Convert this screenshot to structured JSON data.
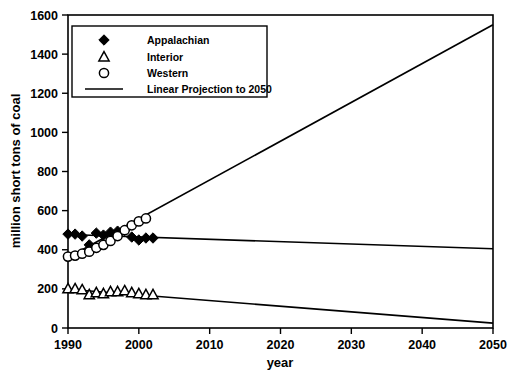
{
  "chart_data": {
    "type": "scatter",
    "title": "",
    "xlabel": "year",
    "ylabel": "million short tons of coal",
    "xlim": [
      1990,
      2050
    ],
    "ylim": [
      0,
      1600
    ],
    "xticks": [
      1990,
      2000,
      2010,
      2020,
      2030,
      2040,
      2050
    ],
    "yticks": [
      0,
      200,
      400,
      600,
      800,
      1000,
      1200,
      1400,
      1600
    ],
    "grid": false,
    "legend_position": "top-left",
    "legend": [
      {
        "label": "Appalachian",
        "marker": "filled-diamond"
      },
      {
        "label": "Interior",
        "marker": "open-triangle"
      },
      {
        "label": "Western",
        "marker": "open-circle"
      },
      {
        "label": "Linear Projection to 2050",
        "marker": "line"
      }
    ],
    "series": [
      {
        "name": "Appalachian",
        "marker": "filled-diamond",
        "x": [
          1990,
          1991,
          1992,
          1993,
          1994,
          1995,
          1996,
          1997,
          1998,
          1999,
          2000,
          2001,
          2002
        ],
        "values": [
          480,
          480,
          470,
          425,
          485,
          475,
          490,
          495,
          500,
          465,
          450,
          460,
          460
        ]
      },
      {
        "name": "Interior",
        "marker": "open-triangle",
        "x": [
          1990,
          1991,
          1992,
          1993,
          1994,
          1995,
          1996,
          1997,
          1998,
          1999,
          2000,
          2001,
          2002
        ],
        "values": [
          200,
          200,
          195,
          170,
          180,
          175,
          185,
          185,
          190,
          180,
          175,
          170,
          170
        ]
      },
      {
        "name": "Western",
        "marker": "open-circle",
        "x": [
          1990,
          1991,
          1992,
          1993,
          1994,
          1995,
          1996,
          1997,
          1998,
          1999,
          2000,
          2001
        ],
        "values": [
          365,
          370,
          380,
          390,
          410,
          425,
          445,
          470,
          500,
          525,
          545,
          560
        ]
      },
      {
        "name": "Linear Projection to 2050 - Western",
        "marker": "line",
        "x": [
          1990,
          2050
        ],
        "values": [
          360,
          1550
        ]
      },
      {
        "name": "Linear Projection to 2050 - Appalachian",
        "marker": "line",
        "x": [
          1990,
          2050
        ],
        "values": [
          478,
          405
        ]
      },
      {
        "name": "Linear Projection to 2050 - Interior",
        "marker": "line",
        "x": [
          1990,
          2050
        ],
        "values": [
          198,
          25
        ]
      }
    ]
  },
  "figure": {
    "cropped_title": ""
  }
}
